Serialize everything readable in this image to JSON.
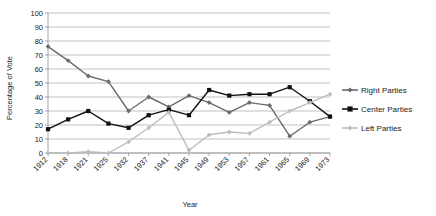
{
  "chart_data": {
    "type": "line",
    "title": "",
    "xlabel": "Year",
    "ylabel": "Percentage of Vote",
    "ylim": [
      0,
      100
    ],
    "ytick_step": 10,
    "grid": true,
    "legend_position": "right",
    "categories": [
      "1912",
      "1918",
      "1921",
      "1925",
      "1932",
      "1937",
      "1941",
      "1945",
      "1949",
      "1953",
      "1957",
      "1961",
      "1965",
      "1969",
      "1973"
    ],
    "yticks": [
      "0",
      "10",
      "20",
      "30",
      "40",
      "50",
      "60",
      "70",
      "80",
      "90",
      "100"
    ],
    "series": [
      {
        "name": "Right Parties",
        "color": "#6b6b6b",
        "marker": "diamond",
        "values": [
          76,
          66,
          55,
          51,
          30,
          40,
          33,
          41,
          36,
          29,
          36,
          34,
          12,
          22,
          26
        ]
      },
      {
        "name": "Center Parties",
        "color": "#111111",
        "marker": "square",
        "values": [
          17,
          24,
          30,
          21,
          18,
          27,
          31,
          27,
          45,
          41,
          42,
          42,
          47,
          37,
          26
        ]
      },
      {
        "name": "Left Parties",
        "color": "#bdbdbd",
        "marker": "diamond",
        "values": [
          0,
          0,
          1,
          0,
          8,
          18,
          29,
          2,
          13,
          15,
          14,
          22,
          30,
          36,
          42
        ]
      }
    ]
  },
  "legend": {
    "items": [
      {
        "label": "Right Parties"
      },
      {
        "label": "Center Parties"
      },
      {
        "label": "Left Parties"
      }
    ]
  }
}
